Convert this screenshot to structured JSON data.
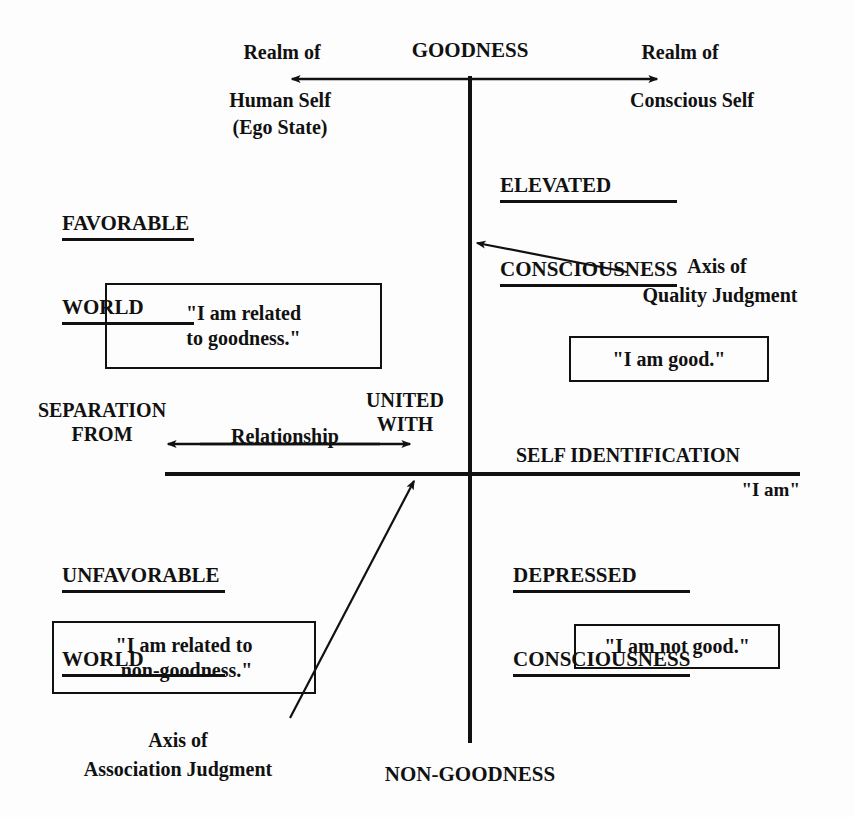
{
  "diagram": {
    "title_axes": {
      "vertical_top": "GOODNESS",
      "vertical_bottom": "NON-GOODNESS",
      "horizontal_left": "SEPARATION\nFROM",
      "horizontal_right": "UNITED\nWITH",
      "horizontal_label": "Relationship",
      "horizontal_right_heading": "SELF IDENTIFICATION",
      "horizontal_right_sub": "\"I am\""
    },
    "realms": {
      "left": "Realm of\nHuman Self\n(Ego State)",
      "left_line1": "Realm of",
      "left_line2": "Human Self",
      "left_line3": "(Ego State)",
      "right_line1": "Realm of",
      "right_line2": "Conscious Self"
    },
    "quadrants": [
      {
        "id": "top-left",
        "heading_line1": "FAVORABLE ",
        "heading_line2": "WORLD",
        "statement": "\"I am related\nto goodness.\""
      },
      {
        "id": "top-right",
        "heading_line1": "ELEVATED ",
        "heading_line2": "CONSCIOUSNESS",
        "statement": "\"I am good.\""
      },
      {
        "id": "bottom-left",
        "heading_line1": "UNFAVORABLE ",
        "heading_line2": "WORLD",
        "statement": "\"I am related to\n non-goodness.\""
      },
      {
        "id": "bottom-right",
        "heading_line1": "DEPRESSED ",
        "heading_line2": "CONSCIOUSNESS",
        "statement": "\"I am not good.\""
      }
    ],
    "callouts": {
      "quality_line1": "Axis of",
      "quality_line2": "Quality Judgment",
      "association_line1": "Axis of",
      "association_line2": "Association Judgment"
    },
    "colors": {
      "ink": "#111111",
      "paper": "#fdfdfd"
    }
  }
}
